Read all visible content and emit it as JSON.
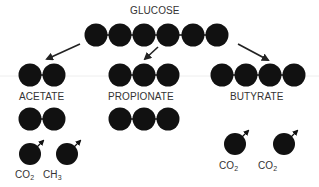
{
  "title": "GLUCOSE",
  "products": [
    {
      "name": "ACETATE",
      "carbons_main": 2,
      "carbons_second": 2
    },
    {
      "name": "PROPIONATE",
      "carbons_main": 3,
      "carbons_second": 3
    },
    {
      "name": "BUTYRATE",
      "carbons_main": 4
    }
  ],
  "byproducts": {
    "acetate": [
      {
        "base": "CO",
        "sub": "2"
      },
      {
        "base": "CH",
        "sub": "3"
      }
    ],
    "butyrate": [
      {
        "base": "CO",
        "sub": "2"
      },
      {
        "base": "CO",
        "sub": "2"
      }
    ]
  },
  "colors": {
    "carbon": "#111111",
    "arrow": "#222222",
    "text": "#333333",
    "guide_line": "#eeeeee"
  }
}
